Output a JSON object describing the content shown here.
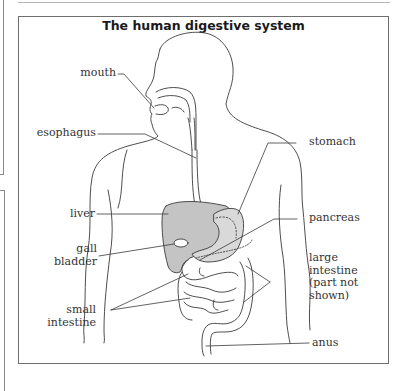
{
  "diagram": {
    "title": "The human digestive system",
    "labels": {
      "mouth": "mouth",
      "esophagus": "esophagus",
      "liver": "liver",
      "gall_bladder_1": "gall",
      "gall_bladder_2": "bladder",
      "small_intestine_1": "small",
      "small_intestine_2": "intestine",
      "stomach": "stomach",
      "pancreas": "pancreas",
      "large_intestine_1": "large",
      "large_intestine_2": "intestine",
      "large_intestine_3": "(part not",
      "large_intestine_4": "shown)",
      "anus": "anus"
    },
    "colors": {
      "line": "#3a3a3a",
      "liver_fill": "#c4c4c4",
      "stomach_fill": "#d6d6d6",
      "frame": "#6e6e6e"
    }
  }
}
